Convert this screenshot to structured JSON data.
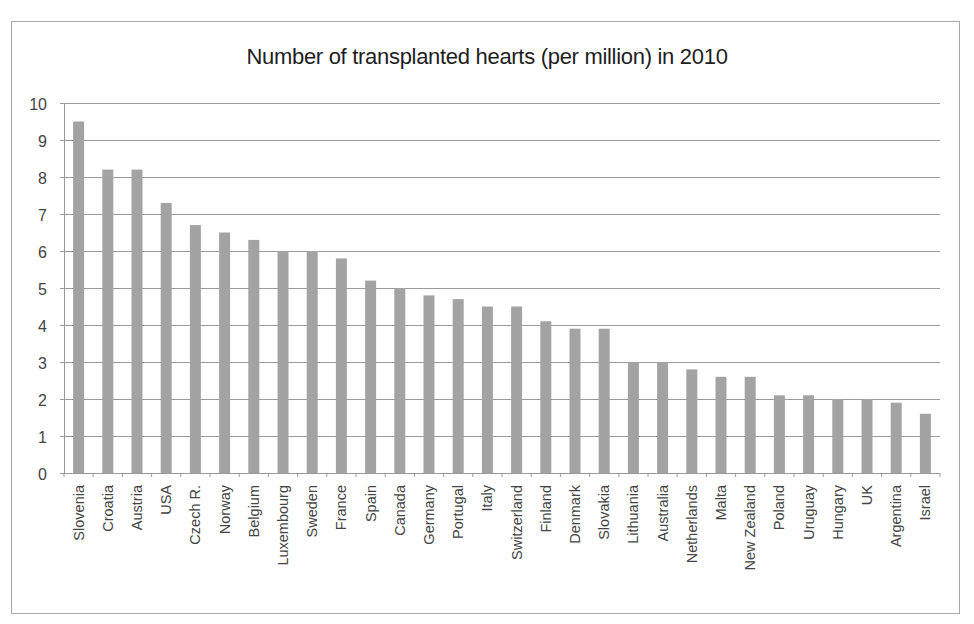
{
  "chart_data": {
    "type": "bar",
    "title": "Number of transplanted hearts (per million) in 2010",
    "xlabel": "",
    "ylabel": "",
    "ylim": [
      0,
      10
    ],
    "yticks": [
      0,
      1,
      2,
      3,
      4,
      5,
      6,
      7,
      8,
      9,
      10
    ],
    "grid": true,
    "legend": null,
    "categories": [
      "Slovenia",
      "Croatia",
      "Austria",
      "USA",
      "Czech R.",
      "Norway",
      "Belgium",
      "Luxembourg",
      "Sweden",
      "France",
      "Spain",
      "Canada",
      "Germany",
      "Portugal",
      "Italy",
      "Switzerland",
      "Finland",
      "Denmark",
      "Slovakia",
      "Lithuania",
      "Australia",
      "Netherlands",
      "Malta",
      "New Zealand",
      "Poland",
      "Uruguay",
      "Hungary",
      "UK",
      "Argentina",
      "Israel"
    ],
    "values": [
      9.5,
      8.2,
      8.2,
      7.3,
      6.7,
      6.5,
      6.3,
      6.0,
      6.0,
      5.8,
      5.2,
      5.0,
      4.8,
      4.7,
      4.5,
      4.5,
      4.1,
      3.9,
      3.9,
      3.0,
      3.0,
      2.8,
      2.6,
      2.6,
      2.1,
      2.1,
      2.0,
      2.0,
      1.9,
      1.6
    ],
    "bar_color": "#a3a3a3",
    "gridline_color": "#9a9a9a"
  }
}
